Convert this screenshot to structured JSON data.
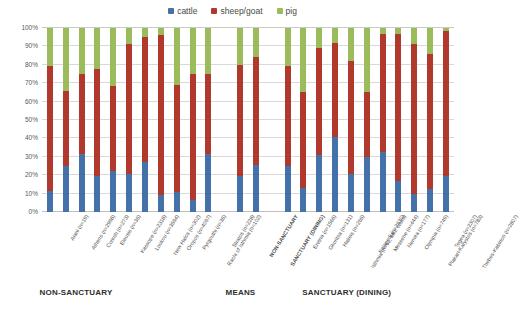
{
  "legend": {
    "position": "top-center",
    "items": [
      {
        "label": "cattle",
        "color": "#4472a8"
      },
      {
        "label": "sheep/goat",
        "color": "#b0382d"
      },
      {
        "label": "pig",
        "color": "#9cbb5a"
      }
    ]
  },
  "axis": {
    "ylabel": "",
    "xlabel": "",
    "yticks": [
      "0%",
      "10%",
      "20%",
      "30%",
      "40%",
      "50%",
      "60%",
      "70%",
      "80%",
      "90%",
      "100%"
    ]
  },
  "group_captions": [
    {
      "label": "NON-SANCTUARY",
      "left_pct": 8.5
    },
    {
      "label": "MEANS",
      "left_pct": 48.5
    },
    {
      "label": "SANCTUARY (DINING)",
      "left_pct": 65.0
    }
  ],
  "chart_data": {
    "type": "bar",
    "subtype": "stacked-100-percent",
    "title": "",
    "subtitle": "",
    "xlabel": "",
    "ylabel": "",
    "ylim": [
      0,
      100
    ],
    "ytick_step": 10,
    "grid": true,
    "legend_position": "top-center",
    "series": [
      {
        "name": "cattle",
        "color": "#4472a8",
        "values": [
          11.5,
          25.0,
          31.5,
          19.5,
          22.5,
          20.5,
          27.0,
          9.5,
          11.0,
          6.5,
          31.5,
          null,
          19.5,
          25.5,
          null,
          25.0,
          13.0,
          31.0,
          41.0,
          20.5,
          30.0,
          32.5,
          17.0,
          10.0,
          12.5,
          19.5
        ]
      },
      {
        "name": "sheep/goat",
        "color": "#b0382d",
        "values": [
          68.0,
          40.5,
          43.5,
          58.5,
          46.0,
          71.0,
          68.0,
          86.5,
          58.0,
          68.5,
          43.5,
          null,
          60.5,
          58.5,
          null,
          54.5,
          52.0,
          58.0,
          51.0,
          61.5,
          35.0,
          64.5,
          80.0,
          81.5,
          73.5,
          79.0
        ]
      },
      {
        "name": "pig",
        "color": "#9cbb5a",
        "values": [
          20.5,
          34.5,
          25.0,
          22.0,
          31.5,
          8.5,
          5.0,
          4.0,
          31.0,
          25.0,
          25.0,
          null,
          20.0,
          16.0,
          null,
          20.5,
          35.0,
          11.0,
          8.0,
          18.0,
          35.0,
          3.0,
          3.0,
          8.5,
          14.0,
          1.5
        ]
      }
    ],
    "categories": [
      "Aiani (n=19)",
      "Athens (n=2998)",
      "Corinth (n=273)",
      "Eleusis (n=36)",
      "Kassope (n=2318)",
      "Loukou (n=3594)",
      "New Halos (n=302)",
      "Oropos (n=4097)",
      "Pyrgouthi (n=36)",
      "Rachi of Isthmia (n=102)",
      "Stratos (n=228)",
      "",
      "NON-SANCTUARY",
      "SANCTUARY (DINING)",
      "",
      "Eretria (n=1566)",
      "Gkoritsa (n=131)",
      "Halieis (n=266)",
      "Isthmia (n=62, MNI count)",
      "Kalapodi (n=2630)",
      "Messene (n=444)",
      "Nemea (n=177)",
      "Olympia (n=749)",
      "Plakari-Karystos (n=783)",
      "Tegea (n=2307)",
      "Thebes-Kabirion (n=2807)"
    ],
    "category_styles": [
      "normal",
      "normal",
      "normal",
      "normal",
      "normal",
      "normal",
      "normal",
      "normal",
      "normal",
      "normal",
      "normal",
      "gap",
      "bold",
      "bold",
      "gap",
      "normal",
      "normal",
      "normal",
      "normal",
      "normal",
      "normal",
      "normal",
      "normal",
      "normal",
      "normal",
      "normal"
    ]
  }
}
